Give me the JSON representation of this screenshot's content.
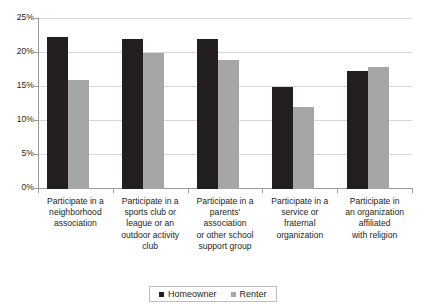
{
  "chart_data": {
    "type": "bar",
    "title": "",
    "xlabel": "",
    "ylabel": "",
    "ylim": [
      0,
      25
    ],
    "ytick_values": [
      25,
      20,
      15,
      10,
      5,
      0
    ],
    "ytick_labels": [
      "25%",
      "20%",
      "15%",
      "10%",
      "5%",
      "0%"
    ],
    "grid": true,
    "legend_position": "bottom",
    "categories": [
      "Participate in a neighborhood association",
      "Participate in a sports club or league or an outdoor activity club",
      "Participate in a parents' association or other school support group",
      "Participate in a service or fraternal organization",
      "Participate in an organization affiliated with religion"
    ],
    "category_lines": [
      [
        "Participate in a",
        "neighborhood",
        "association"
      ],
      [
        "Participate in a",
        "sports club or",
        "league or an",
        "outdoor activity",
        "club"
      ],
      [
        "Participate in a",
        "parents' association",
        "or other school",
        "support group"
      ],
      [
        "Participate in a",
        "service or",
        "fraternal",
        "organization"
      ],
      [
        "Participate in",
        "an organization",
        "affiliated",
        "with religion"
      ]
    ],
    "series": [
      {
        "name": "Homeowner",
        "color": "#231f20",
        "values": [
          22.3,
          22.1,
          22.0,
          15.0,
          17.3
        ]
      },
      {
        "name": "Renter",
        "color": "#a6a6a6",
        "values": [
          16.0,
          20.0,
          18.9,
          12.0,
          18.0
        ]
      }
    ]
  },
  "legend": {
    "entries": [
      {
        "label": "Homeowner"
      },
      {
        "label": "Renter"
      }
    ]
  },
  "colors": {
    "homeowner": "#231f20",
    "renter": "#a6a6a6",
    "axis": "#9a9a9a",
    "grid": "#d6d6d6",
    "text": "#231f20",
    "background": "#ffffff"
  }
}
